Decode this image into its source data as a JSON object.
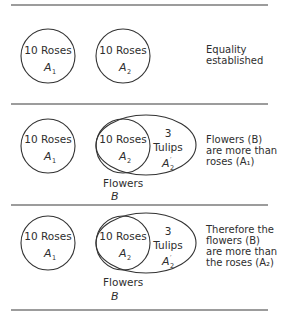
{
  "diagram": {
    "panels": [
      {
        "circle_a1": {
          "label": "10 Roses",
          "var": "A",
          "sub": "1"
        },
        "circle_a2": {
          "label": "10 Roses",
          "var": "A",
          "sub": "2"
        },
        "note": "Equality\nestablished"
      },
      {
        "circle_a1": {
          "label": "10 Roses",
          "var": "A",
          "sub": "1"
        },
        "circle_a2": {
          "label": "10 Roses",
          "var": "A",
          "sub": "2"
        },
        "tulips": {
          "count": "3",
          "label": "Tulips",
          "var": "A",
          "sub": "2",
          "prime": "′"
        },
        "set_b": {
          "label": "Flowers",
          "var": "B"
        },
        "note": "Flowers (B)\nare more than\nroses (A₁)"
      },
      {
        "circle_a1": {
          "label": "10 Roses",
          "var": "A",
          "sub": "1"
        },
        "circle_a2": {
          "label": "10 Roses",
          "var": "A",
          "sub": "2"
        },
        "tulips": {
          "count": "3",
          "label": "Tulips",
          "var": "A",
          "sub": "2",
          "prime": "′"
        },
        "set_b": {
          "label": "Flowers",
          "var": "B"
        },
        "note": "Therefore the\nflowers (B)\nare more than\nthe roses (A₂)"
      }
    ]
  }
}
